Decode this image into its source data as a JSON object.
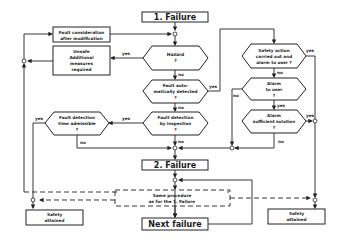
{
  "diagram": {
    "nodes": {
      "failure1": {
        "label": "1. Failure"
      },
      "fault_consideration": {
        "line1": "Fault consideration",
        "line2": "after modification"
      },
      "unsafe": {
        "line1": "Unsafe",
        "line2": "Additional",
        "line3": "measures",
        "line4": "required"
      },
      "hazard": {
        "line1": "Hazard",
        "line2": "?"
      },
      "fault_auto": {
        "line1": "Fault auto-",
        "line2": "matically detected",
        "line3": "?"
      },
      "fault_inspection": {
        "line1": "Fault detection",
        "line2": "by inspection",
        "line3": "?"
      },
      "fault_time": {
        "line1": "Fault detection",
        "line2": "time admissible",
        "line3": "?"
      },
      "safety_action": {
        "line1": "Safety action",
        "line2": "carried out and",
        "line3": "alarm to user ?"
      },
      "alarm_user": {
        "line1": "Alarm",
        "line2": "to user",
        "line3": "?"
      },
      "alarm_sufficient": {
        "line1": "Alarm",
        "line2": "sufficient solution",
        "line3": "?"
      },
      "failure2": {
        "label": "2. Failure"
      },
      "same_procedure": {
        "line1": "Same procedure",
        "line2": "as for the 1. Failure"
      },
      "next_failure": {
        "label": "Next failure"
      },
      "safety_left": {
        "line1": "Safety",
        "line2": "attained"
      },
      "safety_right": {
        "line1": "Safety",
        "line2": "attained"
      }
    },
    "edge_labels": {
      "hazard_yes": "yes",
      "hazard_no": "no",
      "auto_yes": "yes",
      "auto_no": "no",
      "inspection_yes": "yes",
      "inspection_no": "no",
      "time_yes": "yes",
      "time_no": "no",
      "safety_action_yes": "yes",
      "safety_action_no": "no",
      "alarm_user_no": "no",
      "alarm_user_yes": "yes",
      "alarm_sufficient_yes": "yes",
      "alarm_sufficient_no": "no"
    }
  }
}
